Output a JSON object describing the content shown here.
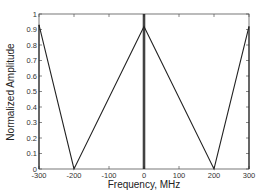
{
  "chart_data": {
    "type": "line",
    "title": "",
    "xlabel": "Frequency, MHz",
    "ylabel": "Normalized Amplitude",
    "xlim": [
      -300,
      300
    ],
    "ylim": [
      0,
      1
    ],
    "xticks": [
      -300,
      -200,
      -100,
      0,
      100,
      200,
      300
    ],
    "yticks": [
      0,
      0.1,
      0.2,
      0.3,
      0.4,
      0.5,
      0.6,
      0.7,
      0.8,
      0.9,
      1
    ],
    "grid": false,
    "legend": null,
    "series": [
      {
        "name": "spectrum envelope",
        "x": [
          -300,
          -200,
          0,
          200,
          300
        ],
        "y": [
          0.93,
          0,
          0.92,
          0,
          0.92
        ]
      },
      {
        "name": "spectral lines",
        "type": "stem",
        "x": [
          -300,
          -2,
          2,
          300
        ],
        "y": [
          0.93,
          1.0,
          1.0,
          0.92
        ]
      }
    ]
  },
  "axes": {
    "xlabel": "Frequency, MHz",
    "ylabel": "Normalized Amplitude",
    "xtick_labels": [
      "-300",
      "-200",
      "-100",
      "0",
      "100",
      "200",
      "300"
    ],
    "ytick_labels": [
      "0",
      "0.1",
      "0.2",
      "0.3",
      "0.4",
      "0.5",
      "0.6",
      "0.7",
      "0.8",
      "0.9",
      "1"
    ]
  },
  "colors": {
    "line": "#222222",
    "axis": "#555555",
    "background": "#ffffff"
  }
}
